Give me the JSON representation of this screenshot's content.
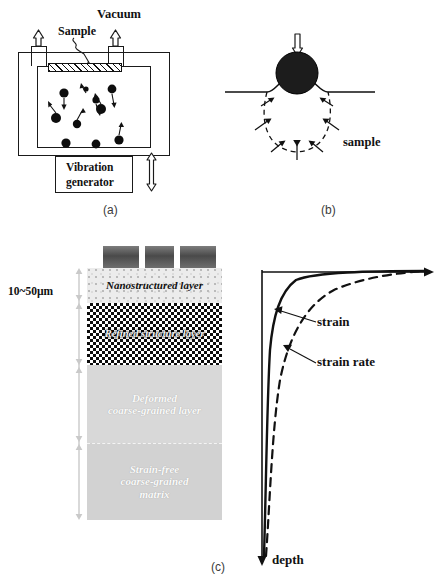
{
  "figure": {
    "panels": [
      {
        "id": "a",
        "caption": "(a)"
      },
      {
        "id": "b",
        "caption": "(b)"
      },
      {
        "id": "c",
        "caption": "(c)"
      }
    ]
  },
  "panel_a": {
    "label_vacuum": "Vacuum",
    "label_sample": "Sample",
    "label_generator_line1": "Vibration",
    "label_generator_line2": "generator",
    "ball_count": 10,
    "balls": [
      {
        "cx": 64,
        "cy": 93,
        "r": 4.6
      },
      {
        "cx": 96,
        "cy": 100,
        "r": 3.6
      },
      {
        "cx": 86,
        "cy": 89,
        "r": 2.6
      },
      {
        "cx": 112,
        "cy": 89,
        "r": 4.4
      },
      {
        "cx": 101,
        "cy": 109,
        "r": 5.0
      },
      {
        "cx": 56,
        "cy": 118,
        "r": 5.0
      },
      {
        "cx": 77,
        "cy": 124,
        "r": 4.2
      },
      {
        "cx": 66,
        "cy": 143,
        "r": 4.6
      },
      {
        "cx": 96,
        "cy": 144,
        "r": 4.4
      },
      {
        "cx": 119,
        "cy": 140,
        "r": 4.6
      }
    ]
  },
  "panel_b": {
    "label_sample": "sample"
  },
  "panel_c": {
    "thickness_label": "10~50µm",
    "layers": [
      {
        "key": "nanostructured",
        "text": "Nanostructured layer"
      },
      {
        "key": "refined",
        "text": "Refined structure layer"
      },
      {
        "key": "deformed",
        "text": "Deformed\ncoarse-grained layer",
        "line1": "Deformed",
        "line2": "coarse-grained layer"
      },
      {
        "key": "matrix",
        "text": "Strain-free\ncoarse-grained\nmatrix",
        "line1": "Strain-free",
        "line2": "coarse-grained",
        "line3": "matrix"
      }
    ],
    "shot_block_count": 3,
    "plot": {
      "axis_label_depth": "depth",
      "curve_strain_label": "strain",
      "curve_strain_rate_label": "strain rate",
      "curves": [
        {
          "name": "strain",
          "style": "solid"
        },
        {
          "name": "strain rate",
          "style": "dashed"
        }
      ]
    }
  },
  "colors": {
    "ink": "#111111",
    "nano_layer": "#ececec",
    "refined_layer": "#0c0c0c",
    "deformed_layer": "#d8d8d8",
    "matrix_layer": "#d2d2d2",
    "shot_block": "#4a4a4a"
  }
}
